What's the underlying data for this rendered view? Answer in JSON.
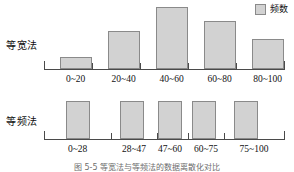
{
  "legend": {
    "swatch_name": "frequency-swatch",
    "label": "频数",
    "color": "#d2d2d2",
    "border_color": "#8a8a8a"
  },
  "rows": {
    "top_label": "等宽法",
    "bottom_label": "等频法"
  },
  "caption": "图 5-5   等宽法与等频法的数据离散化对比",
  "chart_data": [
    {
      "type": "bar",
      "title": "等宽法",
      "xlabel": "",
      "ylabel": "频数",
      "categories": [
        "0~20",
        "20~40",
        "40~60",
        "60~80",
        "80~100"
      ],
      "values": [
        12,
        38,
        62,
        48,
        30
      ],
      "ylim": [
        0,
        66
      ],
      "grid": false,
      "legend_position": "top-right",
      "legend_entries": [
        "频数"
      ],
      "bar_color": "#d2d2d2",
      "bar_border_color": "#8a8a8a",
      "notes": "Equal-width binning: bin widths identical (20 units), bar heights vary"
    },
    {
      "type": "bar",
      "title": "等频法",
      "xlabel": "",
      "ylabel": "频数",
      "categories": [
        "0~28",
        "28~47",
        "47~60",
        "60~75",
        "75~100"
      ],
      "values": [
        38,
        38,
        38,
        38,
        38
      ],
      "ylim": [
        0,
        48
      ],
      "grid": false,
      "legend_position": "top-right",
      "legend_entries": [
        "频数"
      ],
      "bar_color": "#d2d2d2",
      "bar_border_color": "#8a8a8a",
      "notes": "Equal-frequency binning: bar heights identical, bin widths vary"
    }
  ],
  "geometry": {
    "top": {
      "ticks_pct": [
        0,
        20,
        40,
        60,
        80,
        100
      ],
      "bars": [
        {
          "left_pct": 6.5,
          "width_pct": 13.5,
          "height_pct": 18
        },
        {
          "left_pct": 26.5,
          "width_pct": 13.5,
          "height_pct": 58
        },
        {
          "left_pct": 46.5,
          "width_pct": 13.5,
          "height_pct": 94
        },
        {
          "left_pct": 66.5,
          "width_pct": 13.5,
          "height_pct": 73
        },
        {
          "left_pct": 86.5,
          "width_pct": 13.5,
          "height_pct": 45
        }
      ],
      "labels_pct": [
        13.2,
        33.2,
        53.2,
        73.2,
        93.2
      ]
    },
    "bottom": {
      "ticks_pct": [
        0,
        28,
        47,
        60,
        75,
        100
      ],
      "bars": [
        {
          "left_pct": 9.0,
          "width_pct": 10.0,
          "height_pct": 80
        },
        {
          "left_pct": 31.5,
          "width_pct": 10.0,
          "height_pct": 80
        },
        {
          "left_pct": 47.5,
          "width_pct": 10.0,
          "height_pct": 80
        },
        {
          "left_pct": 61.5,
          "width_pct": 10.0,
          "height_pct": 80
        },
        {
          "left_pct": 79.0,
          "width_pct": 10.0,
          "height_pct": 80
        }
      ],
      "labels_pct": [
        14.0,
        37.5,
        52.5,
        67.5,
        87.5
      ]
    }
  }
}
